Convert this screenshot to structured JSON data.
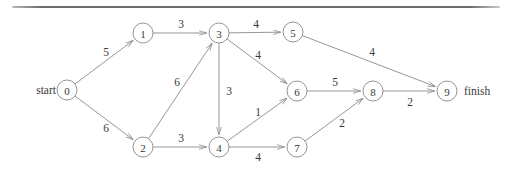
{
  "figure": {
    "type": "directed-weighted-graph",
    "title_rule_visible": true,
    "terminals": {
      "start_label": "start",
      "finish_label": "finish",
      "start_node": "0",
      "finish_node": "9"
    },
    "nodes": [
      {
        "id": "0",
        "label": "0",
        "x": 67,
        "y": 90
      },
      {
        "id": "1",
        "label": "1",
        "x": 143,
        "y": 33
      },
      {
        "id": "2",
        "label": "2",
        "x": 143,
        "y": 147
      },
      {
        "id": "3",
        "label": "3",
        "x": 219,
        "y": 33
      },
      {
        "id": "4",
        "label": "4",
        "x": 219,
        "y": 147
      },
      {
        "id": "5",
        "label": "5",
        "x": 293,
        "y": 32
      },
      {
        "id": "6",
        "label": "6",
        "x": 297,
        "y": 91
      },
      {
        "id": "7",
        "label": "7",
        "x": 297,
        "y": 147
      },
      {
        "id": "8",
        "label": "8",
        "x": 373,
        "y": 91
      },
      {
        "id": "9",
        "label": "9",
        "x": 447,
        "y": 91
      }
    ],
    "node_radius": 10,
    "edges": [
      {
        "from": "0",
        "to": "1",
        "weight": "5",
        "lx": 106,
        "ly": 52
      },
      {
        "from": "0",
        "to": "2",
        "weight": "6",
        "lx": 106,
        "ly": 128
      },
      {
        "from": "1",
        "to": "3",
        "weight": "3",
        "lx": 181,
        "ly": 24
      },
      {
        "from": "2",
        "to": "3",
        "weight": "6",
        "lx": 177,
        "ly": 82
      },
      {
        "from": "2",
        "to": "4",
        "weight": "3",
        "lx": 181,
        "ly": 138
      },
      {
        "from": "3",
        "to": "5",
        "weight": "4",
        "lx": 256,
        "ly": 24
      },
      {
        "from": "3",
        "to": "6",
        "weight": "4",
        "lx": 258,
        "ly": 55
      },
      {
        "from": "3",
        "to": "4",
        "weight": "3",
        "lx": 229,
        "ly": 91
      },
      {
        "from": "4",
        "to": "6",
        "weight": "1",
        "lx": 258,
        "ly": 112
      },
      {
        "from": "4",
        "to": "7",
        "weight": "4",
        "lx": 258,
        "ly": 157
      },
      {
        "from": "5",
        "to": "9",
        "weight": "4",
        "lx": 372,
        "ly": 52
      },
      {
        "from": "6",
        "to": "8",
        "weight": "5",
        "lx": 335,
        "ly": 82
      },
      {
        "from": "7",
        "to": "8",
        "weight": "2",
        "lx": 342,
        "ly": 123
      },
      {
        "from": "8",
        "to": "9",
        "weight": "2",
        "lx": 410,
        "ly": 102
      }
    ],
    "colors": {
      "stroke": "#8a8a8a",
      "text": "#3a3a3a",
      "background": "#ffffff",
      "rule": "#6e6e6e"
    }
  }
}
